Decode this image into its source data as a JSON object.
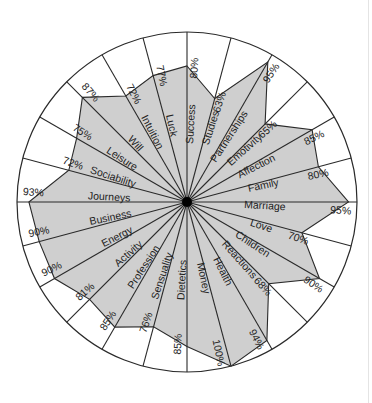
{
  "chart_data": {
    "type": "radar",
    "title": "",
    "unit": "%",
    "range": [
      0,
      100
    ],
    "start_direction": "top",
    "direction": "clockwise",
    "categories": [
      "Success",
      "Studies",
      "Partnerships",
      "Emotivity",
      "Affection",
      "Family",
      "Marriage",
      "Love",
      "Children",
      "Reactions",
      "Health",
      "Money",
      "Dietetics",
      "Sensuality",
      "Profession",
      "Activity",
      "Energy",
      "Business",
      "Journeys",
      "Sociability",
      "Leisure",
      "Will",
      "Intuition",
      "Luck"
    ],
    "values": [
      80,
      63,
      95,
      65,
      85,
      80,
      95,
      70,
      90,
      68,
      94,
      100,
      85,
      76,
      85,
      81,
      90,
      90,
      93,
      72,
      75,
      87,
      72,
      77
    ],
    "value_labels": [
      "80%",
      "63%",
      "95%",
      "65%",
      "85%",
      "80%",
      "95%",
      "70%",
      "90%",
      "68%",
      "94%",
      "100%",
      "85%",
      "76%",
      "85%",
      "81%",
      "90%",
      "90%",
      "93%",
      "72%",
      "75%",
      "87%",
      "72%",
      "77%"
    ],
    "colors": {
      "fill": "#cfcfcf",
      "line": "#2a2a2a",
      "background": "#ffffff",
      "center": "#000000"
    }
  }
}
